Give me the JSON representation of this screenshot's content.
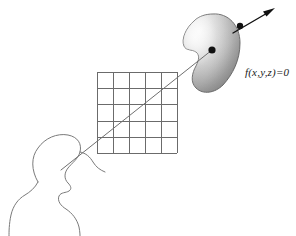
{
  "figure": {
    "background_color": "#ffffff",
    "width": 296,
    "height": 236,
    "labels": {
      "implicit_surface_equation": "f(x,y,z)=0"
    },
    "elements": {
      "viewer": {
        "name": "viewer-head-silhouette",
        "description": "Outline profile of a human head and shoulders facing right",
        "stroke_color": "#808080"
      },
      "image_plane": {
        "name": "image-plane-grid",
        "description": "Square pixel grid representing the view plane",
        "columns": 5,
        "rows": 5,
        "stroke_color": "#6b6b6b"
      },
      "surface": {
        "name": "implicit-surface-blob",
        "description": "Shaded kidney-shaped implicit surface",
        "fill_light": "#f2f2f2",
        "fill_mid": "#b8b8b8",
        "fill_dark": "#8f8f8f",
        "stroke_color": "#707070"
      },
      "eye_ray": {
        "name": "eye-ray",
        "description": "Ray cast from viewer eye through image plane to surface intersection",
        "stroke_color": "#6b6b6b"
      },
      "normal_arrow": {
        "name": "surface-normal-arrow",
        "description": "Arrow leaving the surface with a sample point marker",
        "stroke_color": "#111111"
      },
      "intersection_point": {
        "name": "intersection-point-dot",
        "color": "#111111"
      },
      "sample_point": {
        "name": "sample-point-dot",
        "color": "#111111"
      }
    }
  }
}
